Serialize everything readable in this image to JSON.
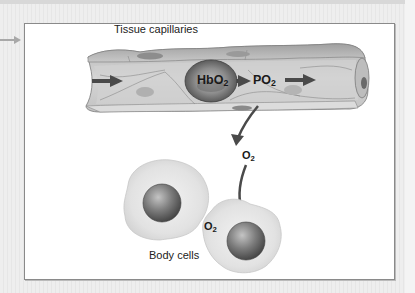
{
  "figure": {
    "title": "Tissue capillaries",
    "labels": {
      "hbo2": {
        "main": "HbO",
        "sub": "2"
      },
      "po2": {
        "main": "PO",
        "sub": "2"
      },
      "o2_released": {
        "main": "O",
        "sub": "2"
      },
      "o2_in_cell": {
        "main": "O",
        "sub": "2"
      },
      "body_cells": "Body cells"
    },
    "icons": {
      "side_arrow": "arrow-right-icon",
      "flow_arrows": "arrow-right-icon",
      "diffusion_arrow": "curved-arrow-down-icon"
    },
    "colors": {
      "background": "#ececec",
      "panel": "#ffffff",
      "panel_border": "#8a8a8a",
      "vessel_wall": "#cfcfcf",
      "vessel_dark": "#9a9a9a",
      "rbc": "#7a7a7a",
      "arrow": "#4a4a4a",
      "side_arrow": "#a8a8a8",
      "cell_body": "#e2e2e2",
      "nucleus": "#707070"
    }
  }
}
